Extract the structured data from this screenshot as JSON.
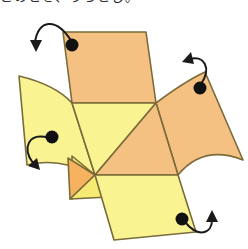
{
  "figure": {
    "caption_clipped": "このとき、うらとじ。",
    "background_color": "#ffffff"
  },
  "palette": {
    "orange_fill": "#f5c183",
    "orange_fill_deep": "#f6b25f",
    "yellow_fill": "#faf391",
    "yellow_fill_warm": "#f7ea72",
    "edge_stroke": "#7a6b3a",
    "arrow_stroke": "#1a1a1a",
    "dot_fill": "#111111"
  },
  "geometry": {
    "stroke_width": 1.6,
    "center_vertex": {
      "x": 95,
      "y": 175
    },
    "faces": [
      {
        "id": "top-panel",
        "name": "top-quadrilateral",
        "color_key": "orange_fill",
        "points": "63,32 146,32 156,103 72,103"
      },
      {
        "id": "center-left-yellow",
        "name": "center-upper-left-triangle",
        "color_key": "yellow_fill",
        "points": "72,103 156,103 95,175"
      },
      {
        "id": "center-right-orange",
        "name": "center-right-triangle",
        "color_key": "orange_fill",
        "points": "156,103 178,175 95,175"
      },
      {
        "id": "left-wing",
        "name": "left-wing-curved-panel",
        "color_key": "yellow_fill",
        "points": "19,76 72,103 95,175",
        "curve": "M19,76 C44,82 62,92 72,103 L95,175 C70,162 44,160 27,165 Z"
      },
      {
        "id": "left-small-yellow",
        "name": "left-lower-small-triangle",
        "color_key": "yellow_fill_warm",
        "points": "72,156 95,175 72,199"
      },
      {
        "id": "left-small-orange",
        "name": "left-lower-small-orange-triangle",
        "color_key": "orange_fill_deep",
        "points": "68,158 95,175 70,199"
      },
      {
        "id": "bottom-small-yellow",
        "name": "bottom-left-small-triangle",
        "color_key": "yellow_fill_warm",
        "points": "70,199 95,175 109,197"
      },
      {
        "id": "right-wing",
        "name": "right-wing-curved-panel",
        "color_key": "orange_fill",
        "points": "156,103 205,72 243,160 178,175",
        "curve": "M156,103 C176,88 192,78 205,72 L243,160 C218,150 196,153 178,175 Z"
      },
      {
        "id": "bottom-panel",
        "name": "bottom-quadrilateral",
        "color_key": "yellow_fill",
        "points": "95,175 178,175 196,232 114,240",
        "curve": "M95,175 L178,175 L196,232 L114,240 Z"
      }
    ]
  },
  "markers": [
    {
      "id": "dot-top-left",
      "name": "fold-marker-top-panel",
      "cx": 72,
      "cy": 45,
      "r": 6.5,
      "arrow_name": "fold-arrow-top-left",
      "arrow_path": "M72,42 C56,16 38,20 35,42",
      "arrow_head": "36,52 30,40 42,40",
      "direction": "down-left"
    },
    {
      "id": "dot-right-wing",
      "name": "fold-marker-right-wing",
      "cx": 200,
      "cy": 88,
      "r": 6.5,
      "arrow_name": "fold-arrow-top-right",
      "arrow_path": "M201,84 C212,68 204,55 190,59",
      "arrow_head": "182,62 191,52 194,64",
      "direction": "up-left"
    },
    {
      "id": "dot-left-wing",
      "name": "fold-marker-left-wing",
      "cx": 52,
      "cy": 137,
      "r": 6.5,
      "arrow_name": "fold-arrow-left",
      "arrow_path": "M49,138 C28,132 22,148 33,163",
      "arrow_head": "40,170 28,166 37,158",
      "direction": "down-right"
    },
    {
      "id": "dot-bottom-panel",
      "name": "fold-marker-bottom-panel",
      "cx": 182,
      "cy": 219,
      "r": 6.5,
      "arrow_name": "fold-arrow-bottom-right",
      "arrow_path": "M185,222 C198,238 212,234 212,220",
      "arrow_head": "212,210 218,222 206,222",
      "direction": "up"
    }
  ]
}
